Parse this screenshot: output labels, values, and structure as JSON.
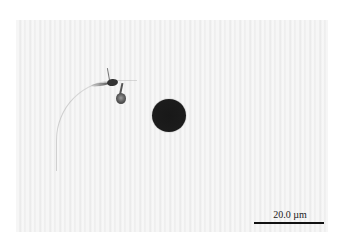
{
  "figure": {
    "type": "light-microscopy-image",
    "background_color": "#f2f2f2",
    "objects": [
      {
        "name": "dark-spherical-particle",
        "color": "#1c1c1c"
      },
      {
        "name": "flagellated-cell",
        "color": "#444444"
      }
    ]
  },
  "scale_bar": {
    "label": "20.0 µm",
    "color": "#111111"
  }
}
